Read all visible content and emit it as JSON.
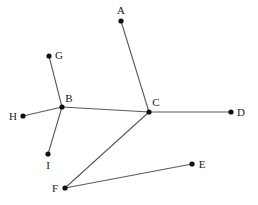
{
  "figure": {
    "type": "node-link-graph",
    "width": 258,
    "height": 205,
    "background_color": "#ffffff",
    "edge_color": "#5a5a5a",
    "vertex_color": "#111111",
    "label_color": "#1a1a1a"
  },
  "vertices": [
    {
      "id": "A",
      "label": "A",
      "x": 121,
      "y": 21,
      "label_x": 121,
      "label_y": 10
    },
    {
      "id": "B",
      "label": "B",
      "x": 62,
      "y": 107,
      "label_x": 69,
      "label_y": 98
    },
    {
      "id": "C",
      "label": "C",
      "x": 149,
      "y": 112,
      "label_x": 156,
      "label_y": 102
    },
    {
      "id": "D",
      "label": "D",
      "x": 231,
      "y": 112,
      "label_x": 241,
      "label_y": 112
    },
    {
      "id": "E",
      "label": "E",
      "x": 192,
      "y": 164,
      "label_x": 202,
      "label_y": 164
    },
    {
      "id": "F",
      "label": "F",
      "x": 65,
      "y": 188,
      "label_x": 55,
      "label_y": 188
    },
    {
      "id": "G",
      "label": "G",
      "x": 49,
      "y": 56,
      "label_x": 59,
      "label_y": 55
    },
    {
      "id": "H",
      "label": "H",
      "x": 23,
      "y": 116,
      "label_x": 13,
      "label_y": 116
    },
    {
      "id": "I",
      "label": "I",
      "x": 48,
      "y": 154,
      "label_x": 48,
      "label_y": 165
    }
  ],
  "edges": [
    {
      "id": "A-C",
      "from": "A",
      "to": "C",
      "x1": 121,
      "y1": 21,
      "x2": 149,
      "y2": 112
    },
    {
      "id": "B-C",
      "from": "B",
      "to": "C",
      "x1": 62,
      "y1": 107,
      "x2": 149,
      "y2": 112
    },
    {
      "id": "C-D",
      "from": "C",
      "to": "D",
      "x1": 149,
      "y1": 112,
      "x2": 231,
      "y2": 112
    },
    {
      "id": "C-F",
      "from": "C",
      "to": "F",
      "x1": 149,
      "y1": 112,
      "x2": 65,
      "y2": 188
    },
    {
      "id": "F-E",
      "from": "F",
      "to": "E",
      "x1": 65,
      "y1": 188,
      "x2": 192,
      "y2": 164
    },
    {
      "id": "B-G",
      "from": "B",
      "to": "G",
      "x1": 62,
      "y1": 107,
      "x2": 49,
      "y2": 56
    },
    {
      "id": "B-H",
      "from": "B",
      "to": "H",
      "x1": 62,
      "y1": 107,
      "x2": 23,
      "y2": 116
    },
    {
      "id": "B-I",
      "from": "B",
      "to": "I",
      "x1": 62,
      "y1": 107,
      "x2": 48,
      "y2": 154
    }
  ]
}
